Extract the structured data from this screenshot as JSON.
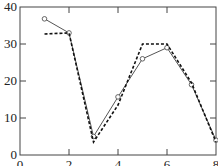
{
  "chart_data": {
    "type": "line",
    "title": "",
    "xlabel": "",
    "ylabel": "",
    "xlim": [
      0,
      8
    ],
    "ylim": [
      0,
      40
    ],
    "xticks": [
      0,
      2,
      4,
      6,
      8
    ],
    "yticks": [
      0,
      10,
      20,
      30,
      40
    ],
    "xtick_labels": [
      "0",
      "2",
      "4",
      "6",
      "8"
    ],
    "ytick_labels": [
      "0",
      "10",
      "20",
      "30",
      "40"
    ],
    "grid": false,
    "legend": null,
    "series": [
      {
        "name": "solid",
        "style": "solid",
        "marker": "circle",
        "color": "#555555",
        "x": [
          1,
          2,
          3,
          4,
          5,
          6,
          7,
          8
        ],
        "y": [
          36.8,
          33,
          5,
          15.7,
          26,
          29,
          19,
          4
        ]
      },
      {
        "name": "dashed",
        "style": "dashed",
        "marker": "none",
        "color": "#111111",
        "x": [
          1,
          2,
          3,
          4,
          5,
          6,
          7,
          8
        ],
        "y": [
          32.7,
          33,
          3.5,
          13.5,
          30,
          30,
          19.5,
          3.5
        ]
      }
    ]
  }
}
